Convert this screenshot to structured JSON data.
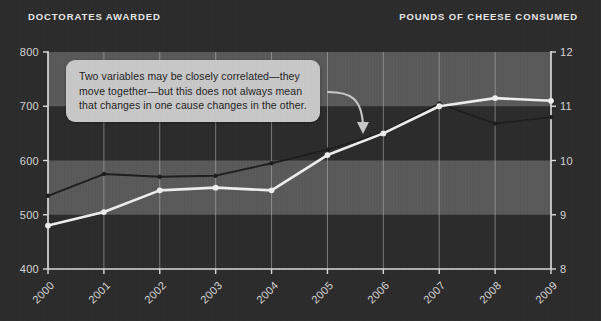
{
  "header": {
    "left_label": "DOCTORATES AWARDED",
    "right_label": "POUNDS OF CHEESE CONSUMED"
  },
  "annotation": {
    "line1": "Two variables may be closely correlated—they",
    "line2": "move together—but this does not always mean",
    "line3": "that changes in one cause changes in the other."
  },
  "colors": {
    "background": "#2b2b2b",
    "band": "#767676",
    "grid": "#b9b9b9",
    "axis": "#dcdcdc",
    "series_doctorates": "#1c1c1c",
    "series_cheese": "#f0f0ee",
    "annotation_bg": "#c9c9c9",
    "annotation_text": "#1d1d1d",
    "tick_text": "#d6d6d6"
  },
  "chart_data": {
    "type": "line",
    "title": "",
    "xlabel": "",
    "categories": [
      "2000",
      "2001",
      "2002",
      "2003",
      "2004",
      "2005",
      "2006",
      "2007",
      "2008",
      "2009"
    ],
    "grid": true,
    "legend": "none",
    "axes": {
      "left": {
        "label": "DOCTORATES AWARDED",
        "ticks": [
          400,
          500,
          600,
          700,
          800
        ],
        "ylim": [
          400,
          800
        ]
      },
      "right": {
        "label": "POUNDS OF CHEESE CONSUMED",
        "ticks": [
          8,
          9,
          10,
          11,
          12
        ],
        "ylim": [
          8,
          12
        ]
      }
    },
    "bands": [
      {
        "from": 700,
        "to": 800,
        "axis": "left"
      },
      {
        "from": 500,
        "to": 600,
        "axis": "left"
      }
    ],
    "series": [
      {
        "name": "Doctorates awarded",
        "axis": "left",
        "color": "#1c1c1c",
        "values": [
          535,
          575,
          570,
          572,
          595,
          620,
          652,
          705,
          668,
          680
        ]
      },
      {
        "name": "Pounds of cheese consumed",
        "axis": "right",
        "color": "#f0f0ee",
        "values": [
          8.8,
          9.05,
          9.45,
          9.5,
          9.45,
          10.1,
          10.5,
          11.0,
          11.15,
          11.1
        ]
      }
    ]
  }
}
